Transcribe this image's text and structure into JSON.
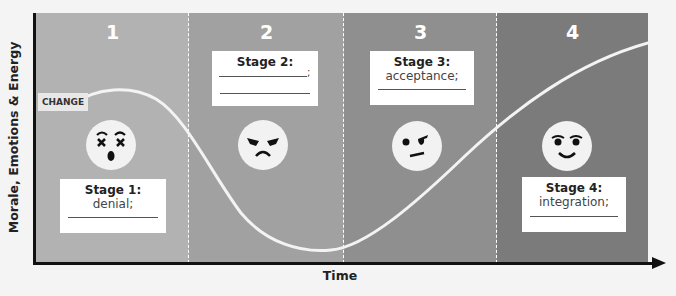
{
  "axes": {
    "y_label": "Morale, Emotions & Energy",
    "x_label": "Time"
  },
  "change_label": "CHANGE",
  "stages": [
    {
      "number": "1",
      "title": "Stage 1:",
      "text": "denial;",
      "face": "shocked-face-icon",
      "color": "#b2b2b2"
    },
    {
      "number": "2",
      "title": "Stage 2:",
      "text": ";",
      "face": "angry-face-icon",
      "color": "#a1a1a1"
    },
    {
      "number": "3",
      "title": "Stage 3:",
      "text": "acceptance;",
      "face": "skeptical-face-icon",
      "color": "#8f8f8f"
    },
    {
      "number": "4",
      "title": "Stage 4:",
      "text": "integration;",
      "face": "happy-face-icon",
      "color": "#7b7b7b"
    }
  ],
  "curve": {
    "description": "Change curve: morale starts at CHANGE, peaks in stage 1, falls through stage 2 to a minimum near end of stage 2, rises through stages 3 and 4 to the highest level",
    "points": [
      [
        0.06,
        0.62
      ],
      [
        0.13,
        0.68
      ],
      [
        0.25,
        0.52
      ],
      [
        0.35,
        0.21
      ],
      [
        0.48,
        0.05
      ],
      [
        0.6,
        0.17
      ],
      [
        0.75,
        0.53
      ],
      [
        1.0,
        0.88
      ]
    ]
  }
}
